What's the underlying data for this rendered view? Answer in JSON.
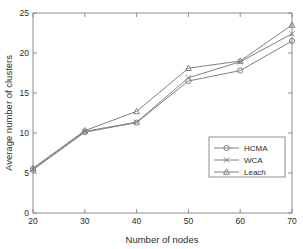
{
  "chart_data": {
    "type": "line",
    "title": "",
    "xlabel": "Number of nodes",
    "ylabel": "Average number of clusters",
    "x": [
      20,
      30,
      40,
      50,
      60,
      70
    ],
    "xticks": [
      "20",
      "30",
      "40",
      "50",
      "60",
      "70"
    ],
    "yticks": [
      "0",
      "5",
      "10",
      "15",
      "20",
      "25"
    ],
    "xlim": [
      20,
      70
    ],
    "ylim": [
      0,
      25
    ],
    "grid": false,
    "legend_position": "lower-right",
    "series": [
      {
        "name": "HCMA",
        "marker": "circle",
        "color": "#808080",
        "values": [
          5.4,
          10.1,
          11.3,
          16.5,
          17.8,
          21.5
        ]
      },
      {
        "name": "WCA",
        "marker": "cross",
        "color": "#808080",
        "values": [
          5.5,
          10.2,
          11.35,
          16.9,
          18.9,
          22.4
        ]
      },
      {
        "name": "Leach",
        "marker": "triangle",
        "color": "#808080",
        "values": [
          5.6,
          10.3,
          12.7,
          18.1,
          19.0,
          23.5
        ]
      }
    ]
  },
  "legend": {
    "items": [
      {
        "label": "HCMA",
        "marker": "circle-marker"
      },
      {
        "label": "WCA",
        "marker": "cross-marker"
      },
      {
        "label": "Leach",
        "marker": "triangle-marker"
      }
    ]
  },
  "colors": {
    "axis": "#8d8d8d",
    "text": "#2b2b2b",
    "series": "#808080",
    "background": "#ffffff"
  }
}
